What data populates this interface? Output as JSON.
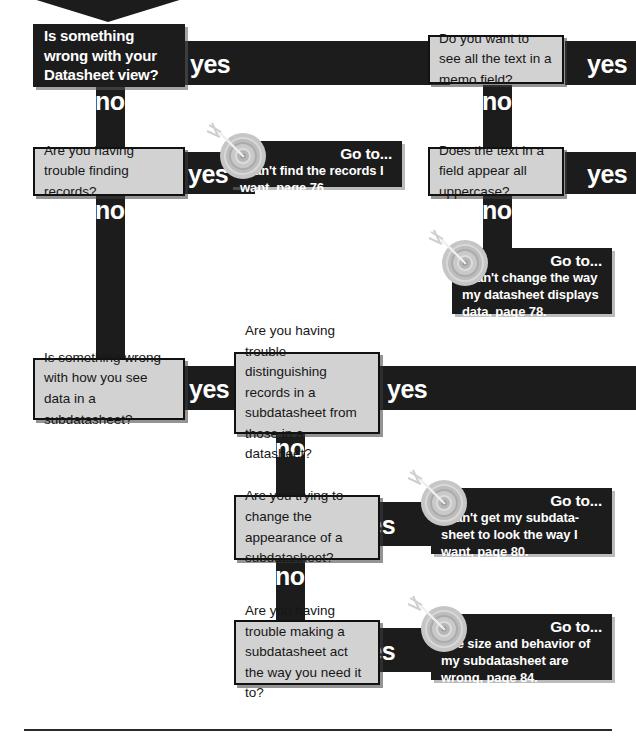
{
  "page": {
    "kind": "troubleshooting-flowchart",
    "topic": "Datasheet view troubleshooting",
    "colors": {
      "ink": "#1c1c1c",
      "box_fill": "#d2d2d2",
      "box_border": "#111111",
      "text_on_dark": "#ffffff",
      "target_ring": "#bdbdbd"
    }
  },
  "labels": {
    "yes": "yes",
    "no": "no"
  },
  "nodes": {
    "start": {
      "id": "start",
      "text": "Is something wrong with your Datasheet view?"
    },
    "q_find_records": {
      "id": "q_find_records",
      "text": "Are you having trouble finding records?"
    },
    "q_memo_field": {
      "id": "q_memo_field",
      "text": "Do you want to see all the text in a memo field?"
    },
    "q_uppercase": {
      "id": "q_uppercase",
      "text": "Does the text in a field appear all uppercase?"
    },
    "q_subdatasheet_view": {
      "id": "q_subdatasheet_view",
      "text": "Is something wrong with how you see data in a subdatasheet?"
    },
    "q_distinguishing": {
      "id": "q_distinguishing",
      "text": "Are you having trouble distinguishing records in a subdatasheet from those in a datasheet?"
    },
    "q_appearance": {
      "id": "q_appearance",
      "text": "Are you trying to change the appearance of a subdatasheet?"
    },
    "q_behavior": {
      "id": "q_behavior",
      "text": "Are you having trouble making a subdatasheet act the way you need it to?"
    }
  },
  "gotos": {
    "heading": "Go to...",
    "find_records": {
      "heading": "Go to...",
      "body": "I can't find the records I want, page 76.",
      "page": "76"
    },
    "datasheet_displays": {
      "heading": "Go to...",
      "body": "I can't change the way my datasheet displays data, page 78.",
      "page": "78"
    },
    "subdatasheet_look": {
      "heading": "Go to...",
      "body": "I can't get my subdata-sheet to look the way I want, page 80.",
      "page": "80"
    },
    "subdatasheet_size": {
      "heading": "Go to...",
      "body": "The size and behavior of my subdatasheet are wrong, page 84.",
      "page": "84"
    }
  },
  "icons": {
    "incoming_arrow": "chevron-down-icon",
    "target": "target-bullseye-icon"
  }
}
